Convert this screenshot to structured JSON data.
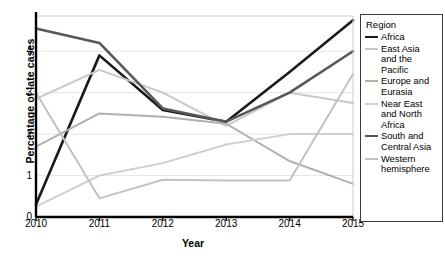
{
  "chart_data": {
    "type": "line",
    "title": "",
    "xlabel": "Year",
    "ylabel": "Percentage of late cases",
    "x": [
      2010,
      2011,
      2012,
      2013,
      2014,
      2015
    ],
    "xtick_labels": [
      "2010",
      "2011",
      "2012",
      "2013",
      "2014",
      "2015"
    ],
    "ytick_labels": [
      "0",
      "1",
      "2",
      "3",
      "4"
    ],
    "yticks": [
      0,
      1,
      2,
      3,
      4
    ],
    "ylim": [
      0,
      4.85
    ],
    "xlim": [
      2010,
      2015
    ],
    "grid": "horizontal",
    "legend_position": "right-outside",
    "legend_title": "Region",
    "series": [
      {
        "name": "Africa",
        "label": "Africa",
        "color": "#1a1a1a",
        "width": 2.6,
        "values": [
          0.3,
          3.9,
          2.58,
          2.3,
          3.5,
          4.75
        ]
      },
      {
        "name": "East Asia and the Pacific",
        "label": "East Asia\nand the\nPacific",
        "color": "#c8c8c8",
        "width": 2.0,
        "values": [
          2.85,
          3.55,
          3.0,
          2.2,
          3.0,
          2.75
        ]
      },
      {
        "name": "Europe and Eurasia",
        "label": "Europe and\nEurasia",
        "color": "#b0b0b0",
        "width": 2.0,
        "values": [
          1.7,
          2.5,
          2.42,
          2.25,
          1.35,
          0.8
        ]
      },
      {
        "name": "Near East and North Africa",
        "label": "Near East\nand North\nAfrica",
        "color": "#cfcfcf",
        "width": 2.0,
        "values": [
          0.25,
          1.0,
          1.3,
          1.75,
          2.0,
          2.0
        ]
      },
      {
        "name": "South and Central Asia",
        "label": "South and\nCentral Asia",
        "color": "#585858",
        "width": 2.6,
        "values": [
          4.55,
          4.2,
          2.62,
          2.3,
          3.0,
          4.0
        ]
      },
      {
        "name": "Western hemisphere",
        "label": "Western\nhemisphere",
        "color": "#c2c2c2",
        "width": 2.0,
        "values": [
          3.0,
          0.45,
          0.9,
          0.88,
          0.88,
          3.45
        ]
      }
    ]
  }
}
